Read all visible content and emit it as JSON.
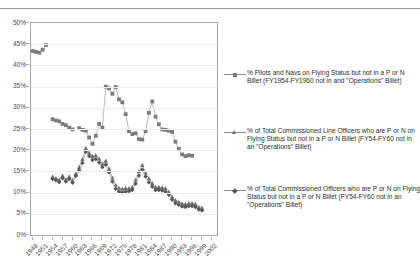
{
  "chart_data": {
    "type": "line",
    "title": "",
    "xlabel": "",
    "ylabel": "",
    "ylim": [
      0,
      50
    ],
    "yunit": "%",
    "ytick_labels": [
      "0%",
      "5%",
      "10%",
      "15%",
      "20%",
      "25%",
      "30%",
      "35%",
      "40%",
      "45%",
      "50%"
    ],
    "ytick_values": [
      0,
      5,
      10,
      15,
      20,
      25,
      30,
      35,
      40,
      45,
      50
    ],
    "grid": true,
    "legend_position": "right",
    "x": [
      1948,
      1949,
      1950,
      1951,
      1952,
      1953,
      1954,
      1955,
      1956,
      1957,
      1958,
      1959,
      1960,
      1961,
      1962,
      1963,
      1964,
      1965,
      1966,
      1967,
      1968,
      1969,
      1970,
      1971,
      1972,
      1973,
      1974,
      1975,
      1976,
      1977,
      1978,
      1979,
      1980,
      1981,
      1982,
      1983,
      1984,
      1985,
      1986,
      1987,
      1988,
      1989,
      1990,
      1991,
      1992,
      1993,
      1994,
      1995,
      1996,
      1997,
      1998,
      1999,
      2000,
      2001,
      2002,
      2003
    ],
    "xtick_labels": [
      "1948",
      "1951",
      "1954",
      "1957",
      "1960",
      "1963",
      "1966",
      "1969",
      "1972",
      "1975",
      "1978",
      "1981",
      "1984",
      "1987",
      "1990",
      "1993",
      "1996",
      "1999",
      "2002"
    ],
    "series": [
      {
        "name": "% Pilots and Navs on Flying Status but not in a P or N Billet (FY1954-FY1960 not in and \"Operations\" Billet)",
        "marker": "square",
        "color": "#7b7b7b",
        "values": [
          43.4,
          43.2,
          43.0,
          43.7,
          44.8,
          null,
          27.3,
          27.0,
          26.8,
          26.2,
          25.9,
          25.3,
          24.9,
          null,
          25.2,
          24.8,
          24.6,
          23.0,
          21.5,
          23.4,
          26.2,
          25.3,
          35.0,
          34.6,
          33.3,
          34.9,
          32.0,
          31.3,
          28.5,
          24.5,
          23.8,
          24.0,
          22.6,
          22.5,
          24.5,
          28.8,
          31.5,
          27.9,
          26.1,
          24.9,
          24.8,
          24.6,
          24.3,
          22.0,
          20.3,
          19.0,
          18.6,
          18.8,
          18.7,
          null,
          null,
          null,
          null,
          null,
          null,
          null
        ]
      },
      {
        "name": "% of Total Commissioned Line Officers who are P or N on Flying Status but not in a P or N Billet (FY54-FY60 not in an \"Operations\" Billet)",
        "marker": "triangle",
        "color": "#6e6e6e",
        "values": [
          null,
          null,
          null,
          null,
          null,
          null,
          13.7,
          13.4,
          13.0,
          14.0,
          13.1,
          13.8,
          12.9,
          14.5,
          16.0,
          17.9,
          20.5,
          19.4,
          18.6,
          18.8,
          18.0,
          16.8,
          17.5,
          15.6,
          13.5,
          11.8,
          11.1,
          10.9,
          11.0,
          11.0,
          11.3,
          13.0,
          15.0,
          16.5,
          14.7,
          13.3,
          12.2,
          11.3,
          11.3,
          11.2,
          11.0,
          10.2,
          9.0,
          8.2,
          7.8,
          7.4,
          7.3,
          7.5,
          7.5,
          7.3,
          6.6,
          6.4,
          null,
          null,
          null,
          null
        ]
      },
      {
        "name": "% of Total Commissioned Officers who are P or N on Flying Status but not in a P or N Billet (FY54-FY60 not in an \"Operations\" Billet)",
        "marker": "diamond",
        "color": "#555555",
        "values": [
          null,
          null,
          null,
          null,
          null,
          null,
          13.2,
          12.9,
          12.5,
          13.4,
          12.6,
          13.2,
          12.3,
          13.9,
          15.2,
          17.0,
          19.6,
          18.6,
          17.7,
          17.9,
          17.1,
          16.0,
          16.6,
          14.8,
          12.6,
          10.9,
          10.2,
          10.0,
          10.2,
          10.3,
          10.6,
          12.1,
          14.0,
          15.4,
          13.8,
          12.4,
          11.4,
          10.6,
          10.6,
          10.5,
          10.2,
          9.5,
          8.3,
          7.5,
          7.1,
          6.7,
          6.6,
          6.8,
          6.8,
          6.6,
          6.0,
          5.8,
          null,
          null,
          null,
          null
        ]
      }
    ]
  },
  "legend": {
    "items": [
      {
        "label": "% Pilots and Navs on Flying Status but not in a P or N Billet (FY1954-FY1960 not in and \"Operations\" Billet)",
        "marker": "square"
      },
      {
        "label": "% of Total Commissioned Line Officers who are P or N on Flying Status but not in a P or N Billet (FY54-FY60 not in an \"Operations\" Billet)",
        "marker": "triangle"
      },
      {
        "label": "% of Total Commissioned Officers who are P or N on Flying Status but not in a P or N Billet (FY54-FY60 not in an \"Operations\" Billet)",
        "marker": "diamond"
      }
    ]
  }
}
